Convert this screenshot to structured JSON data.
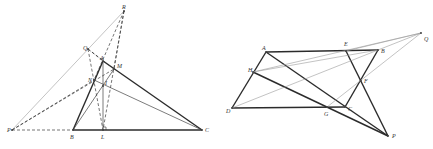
{
  "figures": [
    {
      "id": "triangle-figure",
      "points": {
        "R": [
          124,
          11
        ],
        "Q": [
          88,
          49
        ],
        "A": [
          103,
          61
        ],
        "M": [
          114,
          69
        ],
        "N": [
          94,
          80
        ],
        "I": [
          103,
          86
        ],
        "P": [
          12,
          130
        ],
        "B": [
          73,
          130
        ],
        "L": [
          103,
          130
        ],
        "C": [
          202,
          130
        ]
      },
      "labels": [
        {
          "text": "R",
          "x": 122,
          "y": 9
        },
        {
          "text": "Q",
          "x": 83,
          "y": 50
        },
        {
          "text": "A",
          "x": 100,
          "y": 60
        },
        {
          "text": "M",
          "x": 117,
          "y": 68
        },
        {
          "text": "N",
          "x": 88,
          "y": 82
        },
        {
          "text": "I",
          "x": 105,
          "y": 85
        },
        {
          "text": "P",
          "x": 7,
          "y": 132
        },
        {
          "text": "B",
          "x": 70,
          "y": 139
        },
        {
          "text": "L",
          "x": 101,
          "y": 139
        },
        {
          "text": "C",
          "x": 205,
          "y": 132
        }
      ],
      "segments": [
        {
          "from": "A",
          "to": "B",
          "style": "thick"
        },
        {
          "from": "A",
          "to": "C",
          "style": "thick"
        },
        {
          "from": "B",
          "to": "C",
          "style": "thick"
        },
        {
          "from": "A",
          "to": "L",
          "style": "thin"
        },
        {
          "from": "N",
          "to": "C",
          "style": "thin"
        },
        {
          "from": "B",
          "to": "M",
          "style": "thin"
        },
        {
          "from": "P",
          "to": "R",
          "style": "light"
        },
        {
          "from": "P",
          "to": "B",
          "style": "dashed"
        },
        {
          "from": "P",
          "to": "N",
          "style": "dashed"
        },
        {
          "from": "P",
          "to": "M",
          "style": "dashed"
        },
        {
          "from": "Q",
          "to": "A",
          "style": "dashed"
        },
        {
          "from": "Q",
          "to": "L",
          "style": "dashed"
        },
        {
          "from": "R",
          "to": "N",
          "style": "dashed"
        },
        {
          "from": "R",
          "to": "M",
          "style": "dashed"
        },
        {
          "from": "R",
          "to": "L",
          "style": "dashed"
        },
        {
          "from": "Q",
          "to": "M",
          "style": "dashed"
        }
      ],
      "right_angle_marker": {
        "x": 103,
        "y": 130,
        "size": 3
      }
    },
    {
      "id": "quadrilateral-figure",
      "points": {
        "Q": [
          421,
          33
        ],
        "A": [
          266,
          52
        ],
        "E": [
          346,
          51
        ],
        "B": [
          378,
          50
        ],
        "H": [
          253,
          72
        ],
        "F": [
          361,
          81
        ],
        "D": [
          232,
          108
        ],
        "G": [
          327,
          107
        ],
        "C": [
          345,
          107
        ],
        "P": [
          388,
          136
        ]
      },
      "labels": [
        {
          "text": "A",
          "x": 262,
          "y": 50
        },
        {
          "text": "E",
          "x": 344,
          "y": 46
        },
        {
          "text": "B",
          "x": 381,
          "y": 53
        },
        {
          "text": "Q",
          "x": 424,
          "y": 41
        },
        {
          "text": "H",
          "x": 248,
          "y": 72
        },
        {
          "text": "F",
          "x": 364,
          "y": 83
        },
        {
          "text": "D",
          "x": 226,
          "y": 113
        },
        {
          "text": "G",
          "x": 324,
          "y": 116
        },
        {
          "text": "C",
          "x": 348,
          "y": 111
        },
        {
          "text": "P",
          "x": 392,
          "y": 138
        }
      ],
      "segments": [
        {
          "from": "A",
          "to": "B",
          "style": "thick"
        },
        {
          "from": "B",
          "to": "C",
          "style": "thick"
        },
        {
          "from": "C",
          "to": "D",
          "style": "thick"
        },
        {
          "from": "D",
          "to": "A",
          "style": "thick"
        },
        {
          "from": "A",
          "to": "P",
          "style": "thick"
        },
        {
          "from": "H",
          "to": "P",
          "style": "thick"
        },
        {
          "from": "E",
          "to": "P",
          "style": "thick"
        },
        {
          "from": "H",
          "to": "B",
          "style": "light"
        },
        {
          "from": "D",
          "to": "B",
          "style": "light"
        },
        {
          "from": "E",
          "to": "Q",
          "style": "light"
        },
        {
          "from": "B",
          "to": "Q",
          "style": "light"
        },
        {
          "from": "G",
          "to": "Q",
          "style": "light"
        },
        {
          "from": "H",
          "to": "Q",
          "style": "light"
        }
      ]
    }
  ]
}
